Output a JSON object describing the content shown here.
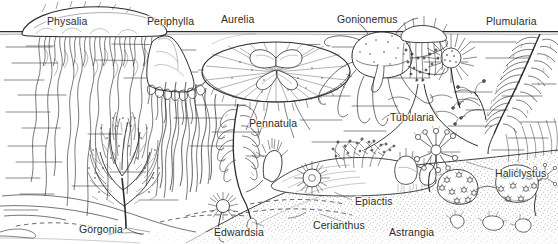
{
  "figure": {
    "kind": "scientific-line-drawing",
    "background_color": "#ffffff",
    "ink_color": "#2b2b2b",
    "width": 558,
    "height": 244
  },
  "labels": [
    {
      "id": "physalia",
      "text": "Physalia",
      "x": 47,
      "y": 16
    },
    {
      "id": "periphylla",
      "text": "Periphylla",
      "x": 147,
      "y": 16
    },
    {
      "id": "aurelia",
      "text": "Aurelia",
      "x": 221,
      "y": 14
    },
    {
      "id": "gonionemus",
      "text": "Gonionemus",
      "x": 337,
      "y": 14
    },
    {
      "id": "plumularia",
      "text": "Plumularia",
      "x": 486,
      "y": 16
    },
    {
      "id": "tubularia",
      "text": "Tubularia",
      "x": 390,
      "y": 112
    },
    {
      "id": "pennatula",
      "text": "Pennatula",
      "x": 249,
      "y": 118
    },
    {
      "id": "haliclystus",
      "text": "Haliclystus",
      "x": 495,
      "y": 168
    },
    {
      "id": "epiactis",
      "text": "Epiactis",
      "x": 355,
      "y": 196
    },
    {
      "id": "gorgonia",
      "text": "Gorgonia",
      "x": 79,
      "y": 224
    },
    {
      "id": "edwardsia",
      "text": "Edwardsia",
      "x": 214,
      "y": 227
    },
    {
      "id": "cerianthus",
      "text": "Cerianthus",
      "x": 313,
      "y": 220
    },
    {
      "id": "astrangia",
      "text": "Astrangia",
      "x": 389,
      "y": 227
    }
  ],
  "scene_elements": {
    "water_surface_label": "water surface line",
    "water_strokes_label": "horizontal water hatch marks",
    "seafloor_label": "stippled sandy seafloor slope",
    "burrow_label": "dashed burrow outlines in sediment"
  }
}
